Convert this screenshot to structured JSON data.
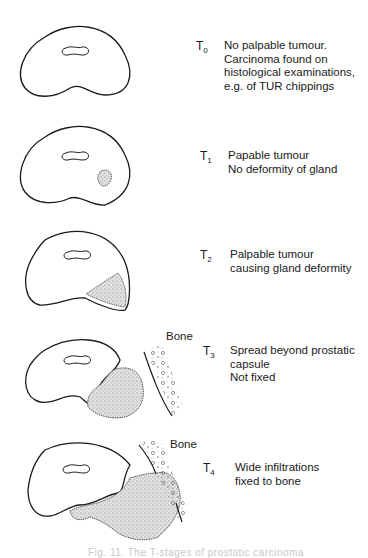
{
  "diagram": {
    "stages": [
      {
        "code": "T",
        "sub": "0",
        "description": "No palpable tumour.\nCarcinoma found on\nhistological examinations,\ne.g. of TUR chippings"
      },
      {
        "code": "T",
        "sub": "1",
        "description": "Papable tumour\nNo deformity of gland"
      },
      {
        "code": "T",
        "sub": "2",
        "description": "Palpable tumour\ncausing gland deformity"
      },
      {
        "code": "T",
        "sub": "3",
        "description": "Spread beyond prostatic\ncapsule\nNot fixed",
        "bone_label": "Bone"
      },
      {
        "code": "T",
        "sub": "4",
        "description": "Wide infiltrations\nfixed to bone",
        "bone_label": "Bone"
      }
    ],
    "caption": "Fig. 11. The T-stages of prostatic carcinoma"
  },
  "colors": {
    "line": "#1a1a1a",
    "tumour_fill": "#cfcfcf",
    "background": "#ffffff"
  }
}
